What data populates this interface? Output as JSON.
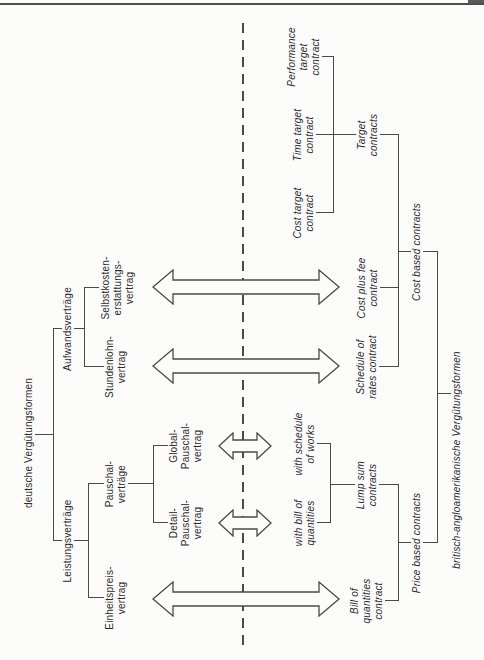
{
  "figure": {
    "type": "bilingual-contract-forms-tree-diagram",
    "orientation": "rotated-90-ccw",
    "divider_style": "dashed",
    "german_tree": {
      "root": "deutsche Vergütungsformen",
      "leistungsvertraege": {
        "label": "Leistungsverträge",
        "einheitspreis": "Einheitspreis-\nvertrag",
        "pauschal": {
          "label": "Pauschal-\nverträge",
          "detail": "Detail-\nPauschal-\nvertrag",
          "global": "Global-\nPauschal-\nvertrag"
        }
      },
      "aufwandsvertraege": {
        "label": "Aufwandsverträge",
        "stundenlohn": "Stundenlohn-\nvertrag",
        "selbstkosten": "Selbstkosten-\nerstattungs-\nvertrag"
      }
    },
    "english_tree": {
      "root": "britisch-angloamerikanische Vergütungsformen",
      "price_based": {
        "label": "Price based contracts",
        "bill_of_quantities": "Bill of\nquantities\ncontract",
        "lump_sum": {
          "label": "Lump sum\ncontracts",
          "with_bill_of_quantities": "with bill of\nquantities",
          "with_schedule_of_works": "with schedule\nof works"
        }
      },
      "cost_based": {
        "label": "Cost based contracts",
        "schedule_of_rates": "Schedule of\nrates contract",
        "cost_plus_fee": "Cost plus fee\ncontract",
        "target": {
          "label": "Target\ncontracts",
          "cost_target": "Cost target\ncontract",
          "time_target": "Time target\ncontract",
          "performance_target": "Performance\ntarget\ncontract"
        }
      }
    },
    "equivalence_arrows": [
      {
        "german": "Einheitspreis-vertrag",
        "english": "Bill of quantities contract",
        "size": "large"
      },
      {
        "german": "Stundenlohn-vertrag",
        "english": "Schedule of rates contract",
        "size": "large"
      },
      {
        "german": "Selbstkosten-erstattungs-vertrag",
        "english": "Cost plus fee contract",
        "size": "large"
      },
      {
        "german": "Detail-Pauschal-vertrag",
        "english": "with bill of quantities",
        "size": "small"
      },
      {
        "german": "Global-Pauschal-vertrag",
        "english": "with schedule of works",
        "size": "small"
      }
    ],
    "colors": {
      "line": "#4a4a4a",
      "text": "#2b2b2b",
      "background": "#fcfcfb",
      "top_rule": "#4f4f4f"
    }
  }
}
